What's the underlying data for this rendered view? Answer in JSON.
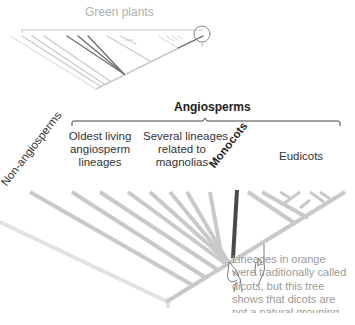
{
  "diagram": {
    "type": "phylogenetic-tree",
    "inset": {
      "title": "Green plants",
      "zoom_circle": "highlighted angiosperm clade"
    },
    "main": {
      "bracket_title": "Angiosperms",
      "clades": [
        {
          "id": "non-angiosperms",
          "label": "Non-angiosperms"
        },
        {
          "id": "oldest",
          "label_lines": [
            "Oldest living",
            "angiosperm",
            "lineages"
          ]
        },
        {
          "id": "magnolias",
          "label_lines": [
            "Several lineages",
            "related to",
            "magnolias"
          ]
        },
        {
          "id": "monocots",
          "label": "Monocots"
        },
        {
          "id": "eudicots",
          "label": "Eudicots"
        }
      ],
      "note": "Lineages in orange were traditionally called dicots, but this tree shows that dicots are not a natural grouping"
    },
    "colors": {
      "background": "#ffffff",
      "inset_branch": "#c8c8c8",
      "inset_highlight": "#707070",
      "branch": "#c9c9c9",
      "non_angio_branch": "#e2e2e2",
      "monocot_branch": "#4a4a4a",
      "label_text": "#333333",
      "note_text": "#9a9a9a"
    }
  }
}
